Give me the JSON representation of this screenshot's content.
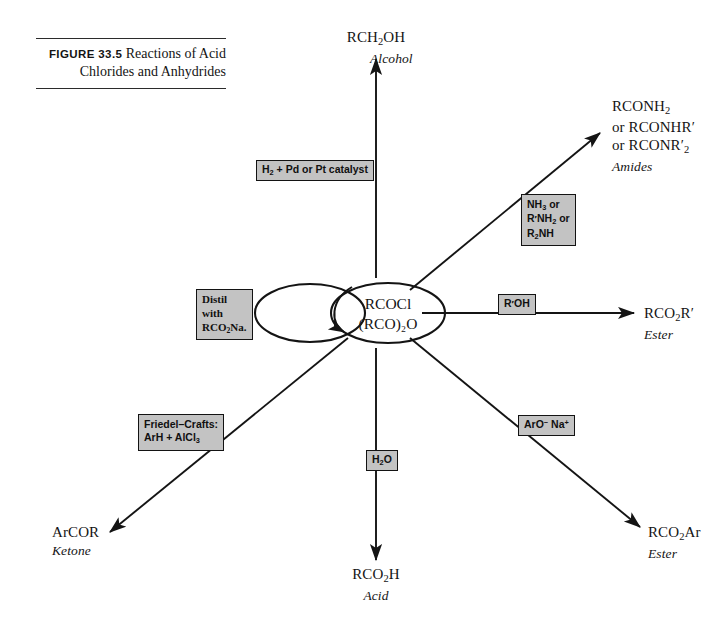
{
  "figure": {
    "label": "FIGURE 33.5",
    "caption": "Reactions of Acid Chlorides and Anhydrides"
  },
  "hub": {
    "line1": "RCOCl",
    "line2": "(RCO)₂O",
    "note": "two overlapping ellipses; left ellipse empty, right ellipse holds the acid chloride / anhydride formulas"
  },
  "chart_data": {
    "type": "diagram",
    "title": "Reactions of Acid Chlorides and Anhydrides",
    "center": [
      "RCOCl",
      "(RCO)₂O"
    ],
    "branches": [
      {
        "direction": "up",
        "reagent": "H₂ + Pd or Pt catalyst",
        "product": "RCH₂OH",
        "product_class": "Alcohol"
      },
      {
        "direction": "upper-right",
        "reagent": "NH₃ or R′NH₂ or R₂NH",
        "product": "RCONH₂ or RCONHR′ or RCONR′₂",
        "product_class": "Amides"
      },
      {
        "direction": "right",
        "reagent": "R′OH",
        "product": "RCO₂R′",
        "product_class": "Ester"
      },
      {
        "direction": "lower-right",
        "reagent": "ArO⁻ Na⁺",
        "product": "RCO₂Ar",
        "product_class": "Ester"
      },
      {
        "direction": "down",
        "reagent": "H₂O",
        "product": "RCO₂H",
        "product_class": "Acid"
      },
      {
        "direction": "lower-left",
        "reagent": "Friedel–Crafts: ArH + AlCl₃",
        "product": "ArCOR",
        "product_class": "Ketone"
      },
      {
        "direction": "left-loop",
        "reagent": "Distil with RCO₂Na.",
        "product": "",
        "product_class": ""
      }
    ]
  },
  "products": {
    "alcohol": {
      "formula_html": "RCH<sub>2</sub>OH",
      "klass": "Alcohol"
    },
    "amides": {
      "line1_html": "RCONH<sub>2</sub>",
      "line2_html": "or RCONHR<span class=\"prime\">′</span>",
      "line3_html": "or RCONR<span class=\"prime\">′</span><sub>2</sub>",
      "klass": "Amides"
    },
    "ester_r": {
      "formula_html": "RCO<sub>2</sub>R<span class=\"prime\">′</span>",
      "klass": "Ester"
    },
    "ester_ar": {
      "formula_html": "RCO<sub>2</sub>Ar",
      "klass": "Ester"
    },
    "acid": {
      "formula_html": "RCO<sub>2</sub>H",
      "klass": "Acid"
    },
    "ketone": {
      "formula_html": "ArCOR",
      "klass": "Ketone"
    }
  },
  "reagents": {
    "hydrogenation": {
      "html": "H<sub>2</sub> + Pd or Pt catalyst"
    },
    "amination": {
      "line1_html": "NH<sub>3</sub> or",
      "line2_html": "R<span class=\"prime\">′</span>NH<sub>2</sub> or",
      "line3_html": "R<sub>2</sub>NH"
    },
    "alcoholysis": {
      "html": "R<span class=\"prime\">′</span>OH"
    },
    "phenoxide": {
      "html": "ArO<sup>−</sup>&nbsp;Na<sup>+</sup>"
    },
    "hydrolysis": {
      "html": "H<sub>2</sub>O"
    },
    "friedel_crafts": {
      "line1_html": "Friedel–Crafts:",
      "line2_html": "ArH + AlCl<sub>3</sub>"
    },
    "distil": {
      "line1_html": "Distil",
      "line2_html": "with",
      "line3_html": "RCO<sub>2</sub>Na."
    }
  },
  "colors": {
    "ink": "#141414",
    "reagent_fill": "#c3c3c3",
    "reagent_border": "#131313",
    "page": "#ffffff"
  }
}
